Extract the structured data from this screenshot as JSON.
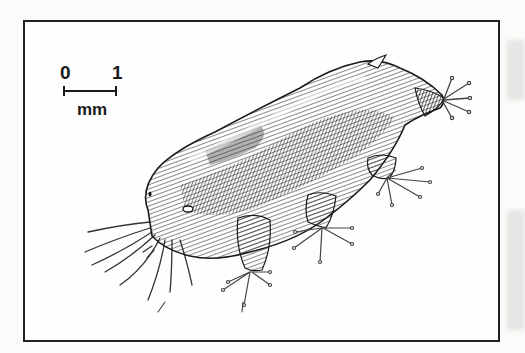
{
  "figure": {
    "type": "scientific-illustration",
    "scale_bar": {
      "start_label": "0",
      "end_label": "1",
      "unit": "mm"
    },
    "colors": {
      "ink": "#1a1a1a",
      "frame": "#222222",
      "paper": "#fefefe",
      "margin_smudge": "#e6e6e4"
    }
  }
}
